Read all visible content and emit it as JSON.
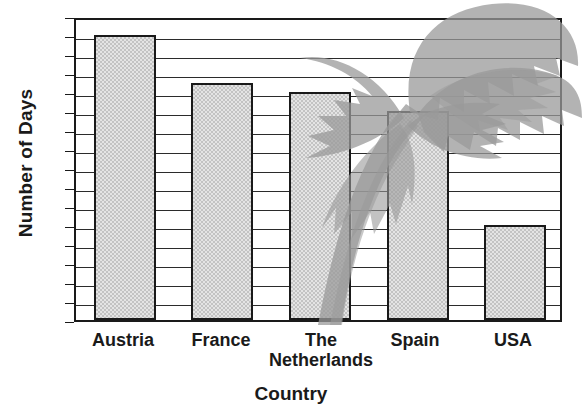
{
  "chart_data": {
    "type": "bar",
    "title": "",
    "xlabel": "Country",
    "ylabel": "Number of Days",
    "categories": [
      "Austria",
      "France",
      "The Netherlands",
      "Spain",
      "USA"
    ],
    "values": [
      30,
      25,
      24,
      22,
      10
    ],
    "ylim": [
      0,
      32
    ],
    "ytick_labels": [
      "0",
      "10",
      "20",
      "30"
    ],
    "ytick_values": [
      0,
      10,
      20,
      30
    ],
    "gridline_interval": 2,
    "grid": true,
    "legend": "none",
    "annotations": [
      "palm-tree watermark overlays the upper-right of the plot area"
    ],
    "colors": {
      "bar_fill": "#c3c3c3",
      "bar_outline": "#1a1a1a",
      "gridline": "#2b2b2b",
      "axis": "#1a1a1a",
      "watermark": "#9a9a9a",
      "background": "#ffffff"
    }
  },
  "axes": {
    "y_title": "Number of Days",
    "x_title": "Country"
  },
  "x_labels": [
    {
      "line1": "Austria",
      "line2": ""
    },
    {
      "line1": "France",
      "line2": ""
    },
    {
      "line1": "The",
      "line2": "Netherlands"
    },
    {
      "line1": "Spain",
      "line2": ""
    },
    {
      "line1": "USA",
      "line2": ""
    }
  ],
  "y_labels": [
    "30",
    "20",
    "10",
    "0"
  ]
}
